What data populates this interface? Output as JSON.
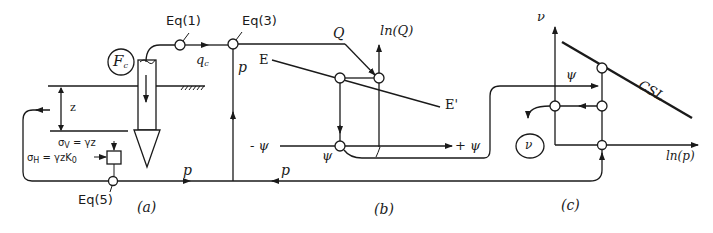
{
  "figure": {
    "panels": [
      {
        "id": "a",
        "caption": "(a)"
      },
      {
        "id": "b",
        "caption": "(b)"
      },
      {
        "id": "c",
        "caption": "(c)"
      }
    ],
    "equations": {
      "eq1": "Eq(1)",
      "eq3": "Eq(3)",
      "eq5": "Eq(5)"
    },
    "panel_a": {
      "force_label": "F",
      "force_sub": "c",
      "depth_label": "z",
      "sigma_v": "σ",
      "sigma_v_sub": "V",
      "sigma_v_expr": " = γz",
      "sigma_h": "σ",
      "sigma_h_sub": "H",
      "sigma_h_expr": " = γzK",
      "sigma_h_expr_sub": "0",
      "qc_label": "q",
      "qc_sub": "c",
      "p_label": "p"
    },
    "panel_b": {
      "q_label": "Q",
      "lnq_axis_label": "ln(Q)",
      "e_label": "E",
      "e_prime_label": "E'",
      "neg_psi_label": "- ψ",
      "pos_psi_label": "+ ψ",
      "psi_label": "ψ",
      "p_label": "p",
      "p_vertical_label": "p"
    },
    "panel_c": {
      "nu_axis_label": "ν",
      "lnp_axis_label": "ln(p)",
      "csl_label": "CSL",
      "psi_label": "ψ",
      "nu_output_label": "ν"
    },
    "colors": {
      "ink": "#1a1a1a",
      "background": "#ffffff"
    }
  }
}
